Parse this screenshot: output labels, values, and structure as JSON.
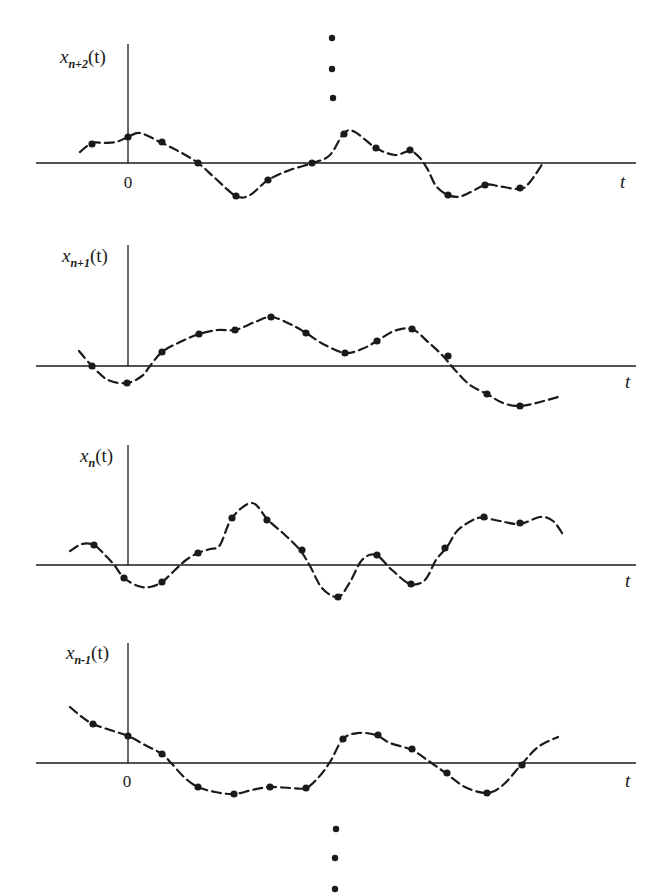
{
  "figure": {
    "time_axis_label": "t",
    "origin_label": "0",
    "ellipsis_top": [
      [
        332,
        38
      ],
      [
        332,
        69
      ],
      [
        333,
        98
      ]
    ],
    "ellipsis_bottom": [
      [
        336,
        829
      ],
      [
        335,
        858
      ],
      [
        335,
        889
      ]
    ],
    "panels": [
      {
        "id": "x_n_plus_2",
        "label_main": "x",
        "label_sub": "n+2",
        "label_tail": "(t)",
        "axis_y": 163,
        "vaxis_x": 128,
        "vaxis_top": 44,
        "haxis_x0": 36,
        "haxis_x1": 636,
        "label_pos": [
          60,
          63
        ],
        "t_pos": [
          620,
          188
        ],
        "show_origin": true,
        "origin_pos": [
          128,
          188
        ],
        "curve": [
          [
            80,
            152
          ],
          [
            92,
            143
          ],
          [
            104,
            143
          ],
          [
            116,
            142
          ],
          [
            128,
            137
          ],
          [
            140,
            133
          ],
          [
            160,
            142
          ],
          [
            180,
            152
          ],
          [
            198,
            163
          ],
          [
            215,
            178
          ],
          [
            236,
            196
          ],
          [
            250,
            195
          ],
          [
            268,
            180
          ],
          [
            290,
            170
          ],
          [
            313,
            163
          ],
          [
            330,
            155
          ],
          [
            344,
            133
          ],
          [
            355,
            132
          ],
          [
            376,
            148
          ],
          [
            395,
            155
          ],
          [
            410,
            151
          ],
          [
            420,
            158
          ],
          [
            428,
            170
          ],
          [
            436,
            186
          ],
          [
            448,
            195
          ],
          [
            462,
            196
          ],
          [
            485,
            185
          ],
          [
            498,
            186
          ],
          [
            520,
            189
          ],
          [
            530,
            182
          ],
          [
            543,
            163
          ]
        ],
        "samples": [
          [
            92,
            144
          ],
          [
            128,
            137
          ],
          [
            162,
            142
          ],
          [
            198,
            163
          ],
          [
            236,
            196
          ],
          [
            268,
            180
          ],
          [
            312,
            163
          ],
          [
            344,
            134
          ],
          [
            376,
            148
          ],
          [
            410,
            150
          ],
          [
            448,
            195
          ],
          [
            485,
            185
          ],
          [
            520,
            188
          ]
        ]
      },
      {
        "id": "x_n_plus_1",
        "label_main": "x",
        "label_sub": "n+1",
        "label_tail": "(t)",
        "axis_y": 366,
        "vaxis_x": 128,
        "vaxis_top": 245,
        "haxis_x0": 36,
        "haxis_x1": 636,
        "label_pos": [
          62,
          262
        ],
        "t_pos": [
          625,
          388
        ],
        "show_origin": false,
        "curve": [
          [
            79,
            351
          ],
          [
            92,
            366
          ],
          [
            108,
            380
          ],
          [
            127,
            383
          ],
          [
            142,
            376
          ],
          [
            150,
            366
          ],
          [
            162,
            352
          ],
          [
            180,
            342
          ],
          [
            199,
            334
          ],
          [
            218,
            330
          ],
          [
            235,
            330
          ],
          [
            255,
            322
          ],
          [
            271,
            317
          ],
          [
            290,
            324
          ],
          [
            306,
            333
          ],
          [
            325,
            345
          ],
          [
            345,
            353
          ],
          [
            362,
            349
          ],
          [
            377,
            341
          ],
          [
            394,
            331
          ],
          [
            412,
            329
          ],
          [
            428,
            342
          ],
          [
            443,
            356
          ],
          [
            455,
            370
          ],
          [
            470,
            385
          ],
          [
            487,
            394
          ],
          [
            503,
            403
          ],
          [
            520,
            406
          ],
          [
            540,
            402
          ],
          [
            558,
            397
          ]
        ],
        "samples": [
          [
            92,
            366
          ],
          [
            127,
            383
          ],
          [
            162,
            352
          ],
          [
            199,
            334
          ],
          [
            235,
            330
          ],
          [
            271,
            317
          ],
          [
            306,
            333
          ],
          [
            345,
            353
          ],
          [
            377,
            341
          ],
          [
            412,
            329
          ],
          [
            448,
            356
          ],
          [
            487,
            394
          ],
          [
            520,
            406
          ]
        ]
      },
      {
        "id": "x_n",
        "label_main": "x",
        "label_sub": "n",
        "label_tail": "(t)",
        "axis_y": 565,
        "vaxis_x": 128,
        "vaxis_top": 445,
        "haxis_x0": 36,
        "haxis_x1": 636,
        "label_pos": [
          80,
          462
        ],
        "t_pos": [
          625,
          587
        ],
        "show_origin": false,
        "curve": [
          [
            70,
            551
          ],
          [
            82,
            544
          ],
          [
            94,
            545
          ],
          [
            106,
            556
          ],
          [
            115,
            566
          ],
          [
            124,
            578
          ],
          [
            138,
            586
          ],
          [
            150,
            587
          ],
          [
            162,
            582
          ],
          [
            175,
            570
          ],
          [
            186,
            560
          ],
          [
            198,
            553
          ],
          [
            210,
            549
          ],
          [
            220,
            545
          ],
          [
            232,
            518
          ],
          [
            252,
            503
          ],
          [
            268,
            520
          ],
          [
            285,
            535
          ],
          [
            300,
            550
          ],
          [
            310,
            566
          ],
          [
            322,
            588
          ],
          [
            338,
            597
          ],
          [
            350,
            582
          ],
          [
            362,
            560
          ],
          [
            376,
            555
          ],
          [
            392,
            570
          ],
          [
            410,
            584
          ],
          [
            425,
            580
          ],
          [
            436,
            560
          ],
          [
            447,
            547
          ],
          [
            458,
            530
          ],
          [
            475,
            519
          ],
          [
            484,
            518
          ],
          [
            500,
            521
          ],
          [
            520,
            524
          ],
          [
            540,
            517
          ],
          [
            553,
            521
          ],
          [
            564,
            536
          ]
        ],
        "samples": [
          [
            94,
            545
          ],
          [
            124,
            578
          ],
          [
            162,
            582
          ],
          [
            198,
            553
          ],
          [
            232,
            518
          ],
          [
            267,
            520
          ],
          [
            302,
            550
          ],
          [
            338,
            597
          ],
          [
            377,
            555
          ],
          [
            411,
            584
          ],
          [
            445,
            548
          ],
          [
            484,
            517
          ],
          [
            520,
            523
          ]
        ]
      },
      {
        "id": "x_n_minus_1",
        "label_main": "x",
        "label_sub": "n-1",
        "label_tail": "(t)",
        "axis_y": 763,
        "vaxis_x": 128,
        "vaxis_top": 643,
        "haxis_x0": 36,
        "haxis_x1": 636,
        "label_pos": [
          66,
          659
        ],
        "t_pos": [
          625,
          787
        ],
        "show_origin": true,
        "origin_pos": [
          127,
          787
        ],
        "curve": [
          [
            70,
            707
          ],
          [
            82,
            717
          ],
          [
            93,
            724
          ],
          [
            110,
            730
          ],
          [
            128,
            736
          ],
          [
            145,
            745
          ],
          [
            162,
            754
          ],
          [
            172,
            764
          ],
          [
            185,
            778
          ],
          [
            198,
            787
          ],
          [
            215,
            792
          ],
          [
            234,
            794
          ],
          [
            252,
            790
          ],
          [
            270,
            787
          ],
          [
            290,
            788
          ],
          [
            306,
            788
          ],
          [
            318,
            778
          ],
          [
            330,
            762
          ],
          [
            343,
            739
          ],
          [
            358,
            733
          ],
          [
            376,
            735
          ],
          [
            390,
            743
          ],
          [
            412,
            750
          ],
          [
            430,
            762
          ],
          [
            447,
            774
          ],
          [
            465,
            787
          ],
          [
            487,
            793
          ],
          [
            503,
            785
          ],
          [
            521,
            765
          ],
          [
            538,
            747
          ],
          [
            558,
            737
          ]
        ],
        "samples": [
          [
            93,
            724
          ],
          [
            128,
            736
          ],
          [
            162,
            754
          ],
          [
            198,
            787
          ],
          [
            234,
            794
          ],
          [
            270,
            787
          ],
          [
            306,
            788
          ],
          [
            343,
            739
          ],
          [
            378,
            735
          ],
          [
            412,
            749
          ],
          [
            447,
            773
          ],
          [
            487,
            793
          ],
          [
            522,
            765
          ]
        ]
      }
    ]
  }
}
